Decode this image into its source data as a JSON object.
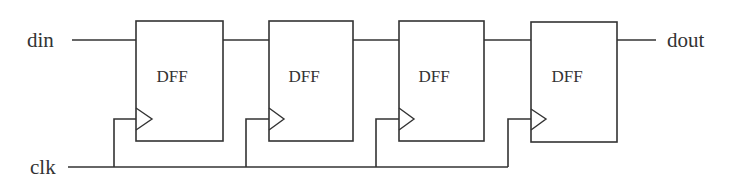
{
  "diagram": {
    "type": "shift-register",
    "colors": {
      "line": "#333333",
      "text": "#333333",
      "background": "#ffffff"
    },
    "inputs": {
      "data": "din",
      "clock": "clk"
    },
    "output": "dout",
    "stages": [
      {
        "label": "DFF"
      },
      {
        "label": "DFF"
      },
      {
        "label": "DFF"
      },
      {
        "label": "DFF"
      }
    ]
  }
}
